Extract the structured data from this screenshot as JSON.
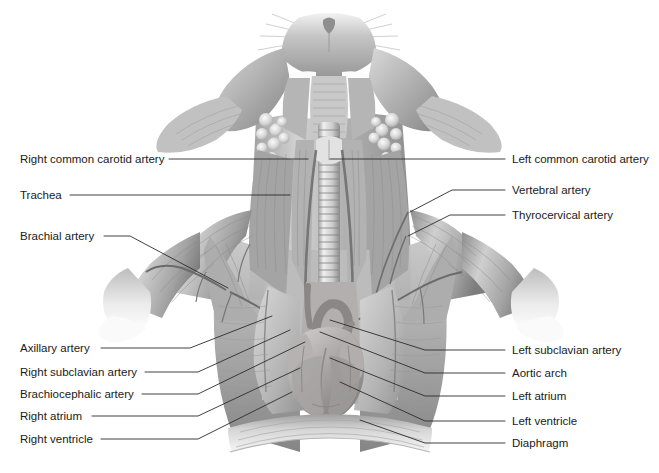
{
  "figure": {
    "style": "grayscale pencil anatomical illustration",
    "colors": {
      "background": "#ffffff",
      "ink": "#1a1a1a",
      "leader_line": "#2b2b2b",
      "tissue_light": "#e8e8e8",
      "tissue_mid": "#b9b9b9",
      "tissue_dark": "#8a8a8a",
      "tissue_deep": "#6b6b6b",
      "heart": "#a9a4a4",
      "highlight": "#fdfdfd"
    }
  },
  "labels_left": [
    {
      "id": "right-common-carotid-artery",
      "text": "Right common carotid artery",
      "x": 20,
      "y": 153,
      "line": [
        [
          169,
          159
        ],
        [
          305,
          159
        ],
        [
          308,
          159
        ]
      ]
    },
    {
      "id": "trachea",
      "text": "Trachea",
      "x": 20,
      "y": 189,
      "line": [
        [
          70,
          195
        ],
        [
          290,
          195
        ]
      ]
    },
    {
      "id": "brachial-artery",
      "text": "Brachial artery",
      "x": 20,
      "y": 230,
      "line": [
        [
          104,
          236
        ],
        [
          130,
          236
        ],
        [
          228,
          288
        ]
      ]
    },
    {
      "id": "axillary-artery",
      "text": "Axillary artery",
      "x": 20,
      "y": 342,
      "line": [
        [
          101,
          348
        ],
        [
          190,
          348
        ],
        [
          272,
          316
        ]
      ]
    },
    {
      "id": "right-subclavian-artery",
      "text": "Right subclavian artery",
      "x": 20,
      "y": 366,
      "line": [
        [
          145,
          372
        ],
        [
          198,
          372
        ],
        [
          290,
          330
        ]
      ]
    },
    {
      "id": "brachiocephalic-artery",
      "text": "Brachiocephalic artery",
      "x": 20,
      "y": 388,
      "line": [
        [
          142,
          394
        ],
        [
          198,
          394
        ],
        [
          305,
          342
        ]
      ]
    },
    {
      "id": "right-atrium",
      "text": "Right atrium",
      "x": 20,
      "y": 410,
      "line": [
        [
          92,
          416
        ],
        [
          198,
          416
        ],
        [
          300,
          368
        ]
      ]
    },
    {
      "id": "right-ventricle",
      "text": "Right ventricle",
      "x": 20,
      "y": 433,
      "line": [
        [
          101,
          439
        ],
        [
          198,
          439
        ],
        [
          292,
          392
        ]
      ]
    }
  ],
  "labels_right": [
    {
      "id": "left-common-carotid-artery",
      "text": "Left common carotid artery",
      "x": 512,
      "y": 153,
      "line": [
        [
          505,
          159
        ],
        [
          330,
          159
        ]
      ]
    },
    {
      "id": "vertebral-artery",
      "text": "Vertebral artery",
      "x": 512,
      "y": 184,
      "line": [
        [
          505,
          190
        ],
        [
          452,
          190
        ],
        [
          410,
          212
        ]
      ]
    },
    {
      "id": "thyrocervical-artery",
      "text": "Thyrocervical artery",
      "x": 512,
      "y": 209,
      "line": [
        [
          505,
          215
        ],
        [
          450,
          215
        ],
        [
          408,
          236
        ]
      ]
    },
    {
      "id": "left-subclavian-artery",
      "text": "Left subclavian artery",
      "x": 512,
      "y": 344,
      "line": [
        [
          505,
          350
        ],
        [
          425,
          350
        ],
        [
          330,
          320
        ]
      ]
    },
    {
      "id": "aortic-arch",
      "text": "Aortic arch",
      "x": 512,
      "y": 367,
      "line": [
        [
          505,
          373
        ],
        [
          425,
          373
        ],
        [
          320,
          332
        ]
      ]
    },
    {
      "id": "left-atrium",
      "text": "Left atrium",
      "x": 512,
      "y": 390,
      "line": [
        [
          505,
          396
        ],
        [
          425,
          396
        ],
        [
          330,
          358
        ]
      ]
    },
    {
      "id": "left-ventricle",
      "text": "Left ventricle",
      "x": 512,
      "y": 415,
      "line": [
        [
          505,
          421
        ],
        [
          425,
          421
        ],
        [
          340,
          382
        ]
      ]
    },
    {
      "id": "diaphragm",
      "text": "Diaphragm",
      "x": 512,
      "y": 437,
      "line": [
        [
          505,
          443
        ],
        [
          425,
          443
        ],
        [
          360,
          420
        ]
      ]
    }
  ]
}
